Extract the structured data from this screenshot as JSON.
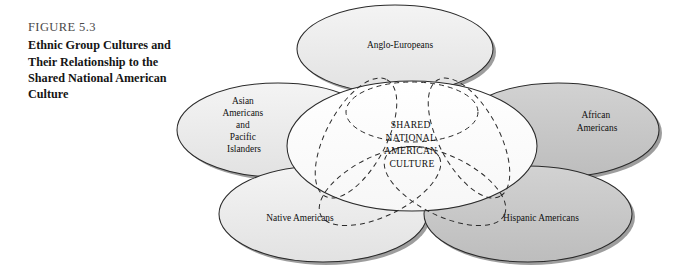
{
  "figure": {
    "number": "FIGURE 5.3",
    "title_lines": [
      "Ethnic Group Cultures and",
      "Their Relationship to the",
      "Shared National American",
      "Culture"
    ],
    "title_full": "Ethnic Group Cultures and Their Relationship to the Shared National American Culture"
  },
  "diagram": {
    "type": "venn-overlap-ellipses",
    "center": {
      "name": "shared-national-american-culture",
      "lines": [
        "SHARED",
        "NATIONAL",
        "AMERICAN",
        "CULTURE"
      ],
      "text": "SHARED NATIONAL AMERICAN CULTURE",
      "fill": "#ffffff",
      "outline_style": "dashed"
    },
    "groups": [
      {
        "id": "anglo-europeans",
        "lines": [
          "Anglo-Europeans"
        ],
        "text": "Anglo-Europeans",
        "position": "top",
        "fill": "#e6e6e6"
      },
      {
        "id": "asian-americans-and-pacific-islanders",
        "lines": [
          "Asian",
          "Americans",
          "and",
          "Pacific",
          "Islanders"
        ],
        "text": "Asian Americans and Pacific Islanders",
        "position": "upper-left",
        "fill": "#eeeeee"
      },
      {
        "id": "african-americans",
        "lines": [
          "African",
          "Americans"
        ],
        "text": "African Americans",
        "position": "upper-right",
        "fill": "#c9c9c9"
      },
      {
        "id": "native-americans",
        "lines": [
          "Native Americans"
        ],
        "text": "Native Americans",
        "position": "lower-left",
        "fill": "#e9e9e9"
      },
      {
        "id": "hispanic-americans",
        "lines": [
          "Hispanic Americans"
        ],
        "text": "Hispanic Americans",
        "position": "lower-right",
        "fill": "#c9c9c9"
      }
    ],
    "colors": {
      "page_background": "#ffffff",
      "outline": "#2a2a2a",
      "shadow": "#8a8a8a",
      "center_fill": "#ffffff",
      "text": "#101010",
      "caption_number": "#4a4a4a"
    }
  }
}
